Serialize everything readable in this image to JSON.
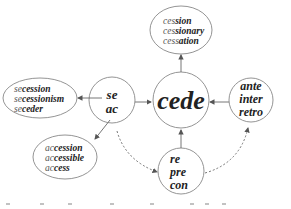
{
  "diagram": {
    "center": {
      "label": "cede"
    },
    "nodes": {
      "prefix_left": {
        "lines": [
          "se",
          "ac"
        ]
      },
      "prefix_right": {
        "lines": [
          "ante",
          "inter",
          "retro"
        ]
      },
      "prefix_bottom": {
        "lines": [
          "re",
          "pre",
          "con"
        ]
      }
    },
    "derived": {
      "top": {
        "lines": [
          {
            "stem": "ces",
            "suffix": "sion"
          },
          {
            "stem": "ces",
            "suffix": "sionary"
          },
          {
            "stem": "cess",
            "suffix": "ation"
          }
        ]
      },
      "se_family": {
        "lines": [
          {
            "stem": "se",
            "suffix": "cession"
          },
          {
            "stem": "se",
            "suffix": "cessionism"
          },
          {
            "stem": "se",
            "suffix": "ceder"
          }
        ]
      },
      "ac_family": {
        "lines": [
          {
            "stem": "ac",
            "suffix": "cession"
          },
          {
            "stem": "ac",
            "suffix": "cessible"
          },
          {
            "stem": "ac",
            "suffix": "cess"
          }
        ]
      }
    },
    "edges": [
      {
        "from": "cede",
        "to": "top",
        "style": "solid"
      },
      {
        "from": "prefix_left",
        "to": "cede",
        "style": "solid"
      },
      {
        "from": "prefix_right",
        "to": "cede",
        "style": "solid"
      },
      {
        "from": "prefix_bottom",
        "to": "cede",
        "style": "solid"
      },
      {
        "from": "prefix_left",
        "to": "se_family",
        "style": "solid"
      },
      {
        "from": "prefix_left",
        "to": "ac_family",
        "style": "solid"
      },
      {
        "from": "prefix_left",
        "to": "prefix_bottom",
        "style": "dashed"
      },
      {
        "from": "prefix_bottom",
        "to": "prefix_right",
        "style": "dashed"
      }
    ],
    "colors": {
      "stroke": "#777777",
      "text": "#222222",
      "background": "#ffffff"
    }
  }
}
